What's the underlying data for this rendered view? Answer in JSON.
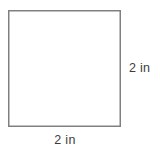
{
  "figure": {
    "type": "geometry-diagram",
    "shape": "square",
    "canvas": {
      "width": 160,
      "height": 153,
      "background": "#ffffff"
    },
    "square": {
      "name": "square-outline",
      "x": 8,
      "y": 10,
      "width": 113,
      "height": 117,
      "stroke_color": "#808080",
      "stroke_width": 1.5,
      "fill": "none"
    },
    "labels": {
      "right_side": "2 in",
      "bottom_side": "2 in"
    },
    "measurements": {
      "side_length_value": 2,
      "unit": "in"
    }
  }
}
